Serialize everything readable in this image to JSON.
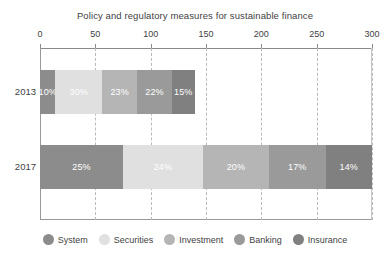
{
  "chart_data": {
    "type": "bar",
    "orientation": "horizontal",
    "stacked": true,
    "title": "Policy and regulatory measures for sustainable finance",
    "xlabel": "",
    "ylabel": "",
    "xlim": [
      0,
      300
    ],
    "xticks": [
      0,
      50,
      100,
      150,
      200,
      250,
      300
    ],
    "xtick_labels": [
      "0",
      "50",
      "100",
      "150",
      "200",
      "250",
      "300"
    ],
    "grid": true,
    "grid_style": "dashed-vertical",
    "axis_position": "top",
    "legend_position": "bottom",
    "categories": [
      "2013",
      "2017"
    ],
    "series": [
      {
        "name": "System",
        "color": "#8c8c8c",
        "values": [
          14,
          75
        ],
        "labels": [
          "10%",
          "25%"
        ]
      },
      {
        "name": "Securities",
        "color": "#e0e0e0",
        "values": [
          42,
          72
        ],
        "labels": [
          "30%",
          "24%"
        ]
      },
      {
        "name": "Investment",
        "color": "#b5b5b5",
        "values": [
          32,
          60
        ],
        "labels": [
          "23%",
          "20%"
        ]
      },
      {
        "name": "Banking",
        "color": "#9a9a9a",
        "values": [
          31,
          51
        ],
        "labels": [
          "22%",
          "17%"
        ]
      },
      {
        "name": "Insurance",
        "color": "#808080",
        "values": [
          21,
          42
        ],
        "labels": [
          "15%",
          "14%"
        ]
      }
    ],
    "totals": [
      140,
      300
    ],
    "annotations": []
  },
  "legend": {
    "items": [
      {
        "label": "System",
        "color": "#8c8c8c"
      },
      {
        "label": "Securities",
        "color": "#e0e0e0"
      },
      {
        "label": "Investment",
        "color": "#b5b5b5"
      },
      {
        "label": "Banking",
        "color": "#9a9a9a"
      },
      {
        "label": "Insurance",
        "color": "#808080"
      }
    ]
  }
}
